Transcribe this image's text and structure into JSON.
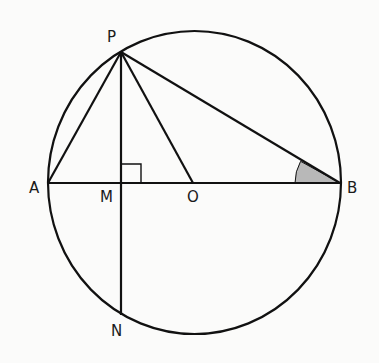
{
  "diagram": {
    "type": "geometry",
    "colors": {
      "stroke": "#111111",
      "shade": "#b8b8b8",
      "background": "#fbfbfa"
    },
    "circle": {
      "cx": 194.5,
      "cy": 182.5,
      "rx": 146.5,
      "ry": 151.5
    },
    "points": {
      "P": {
        "label": "P",
        "x": 121,
        "y": 52
      },
      "A": {
        "label": "A",
        "x": 48,
        "y": 183
      },
      "M": {
        "label": "M",
        "x": 121,
        "y": 183
      },
      "O": {
        "label": "O",
        "x": 193,
        "y": 183
      },
      "B": {
        "label": "B",
        "x": 340,
        "y": 183
      },
      "N": {
        "label": "N",
        "x": 121,
        "y": 315
      }
    },
    "segments": [
      "AB",
      "PA",
      "PM",
      "MN",
      "PO",
      "PB"
    ],
    "right_angle_at": "M",
    "shaded_angle": "PBA"
  }
}
